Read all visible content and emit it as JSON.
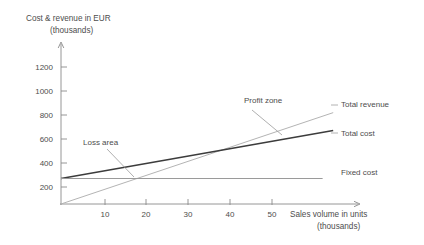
{
  "chart_data": {
    "type": "line",
    "title": "",
    "ylabel": "Cost & revenue in EUR",
    "ylabel_sub": "(thousands)",
    "xlabel": "Sales volume in units",
    "xlabel_sub": "(thousands)",
    "xlim": [
      0,
      60
    ],
    "ylim": [
      0,
      1300
    ],
    "grid": false,
    "legend_position": "right-inline",
    "xticks": [
      10,
      20,
      30,
      40,
      50
    ],
    "xtick_labels": [
      "10",
      "20",
      "30",
      "40",
      "50"
    ],
    "yticks": [
      200,
      400,
      600,
      800,
      1000,
      1200
    ],
    "ytick_labels": [
      "200",
      "400",
      "600",
      "800",
      "1000",
      "1200"
    ],
    "series": [
      {
        "name": "Total revenue",
        "color": "#b4b4b4",
        "x": [
          0,
          64.5
        ],
        "values": [
          0,
          1075
        ],
        "label": "Total revenue"
      },
      {
        "name": "Total cost",
        "color": "#3c3c3c",
        "x": [
          0,
          64.5
        ],
        "values": [
          300,
          865
        ],
        "label": "Total cost"
      },
      {
        "name": "Fixed cost",
        "color": "#9a9a9a",
        "x": [
          0,
          62
        ],
        "values": [
          300,
          300
        ],
        "label": "Fixed cost"
      }
    ],
    "annotations": [
      {
        "text": "Loss area",
        "x": 8,
        "y": 530
      },
      {
        "text": "Profit zone",
        "x": 45,
        "y": 885
      }
    ],
    "breakeven": {
      "x": 18,
      "y": 300
    }
  },
  "axes": {
    "y_title": "Cost & revenue in EUR",
    "y_title_sub": "(thousands)",
    "x_title": "Sales volume in units",
    "x_title_sub": "(thousands)"
  },
  "ticks": {
    "y": [
      "1200",
      "1000",
      "800",
      "600",
      "400",
      "200"
    ],
    "x": [
      "10",
      "20",
      "30",
      "40",
      "50"
    ]
  },
  "labels": {
    "total_revenue": "Total revenue",
    "total_cost": "Total cost",
    "fixed_cost": "Fixed cost",
    "loss_area": "Loss area",
    "profit_zone": "Profit zone"
  },
  "colors": {
    "total_revenue": "#b4b4b4",
    "total_cost": "#3c3c3c",
    "fixed_cost": "#9a9a9a",
    "axis": "#8a8a8a",
    "text": "#4d4d4d",
    "background": "#ffffff"
  }
}
